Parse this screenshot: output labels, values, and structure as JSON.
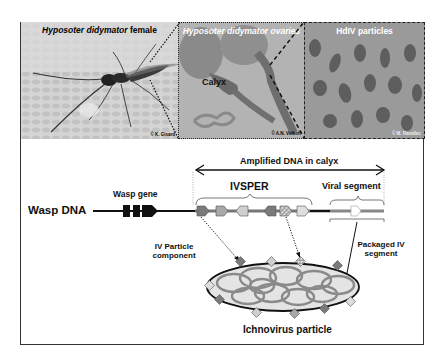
{
  "panels": {
    "female": {
      "title_italic": "Hyposoter didymator",
      "title_normal": " female",
      "credit": "© K. Gisard"
    },
    "ovaries": {
      "title": "Hyposoter didymator ovaries",
      "label": "Calyx",
      "credit": "© A.N. Volkoff"
    },
    "particles": {
      "title": "HdIV particles",
      "credit": "© M. Ravallec"
    }
  },
  "diagram": {
    "wasp_dna": "Wasp DNA",
    "wasp_gene": "Wasp gene",
    "amplified": "Amplified DNA in calyx",
    "ivsper": "IVSPER",
    "viral_segment": "Viral segment",
    "iv_particle_component_l1": "IV Particle",
    "iv_particle_component_l2": "component",
    "packaged_l1": "Packaged IV",
    "packaged_l2": "segment",
    "ichnovirus": "Ichnovirus particle"
  },
  "colors": {
    "dark_gene": "#7a7a7a",
    "mid_gene": "#a8a8a8",
    "light_gene": "#cfcfcf",
    "particle_fill": "#e4e4e4",
    "segment_ring": "#8a8a8a"
  }
}
